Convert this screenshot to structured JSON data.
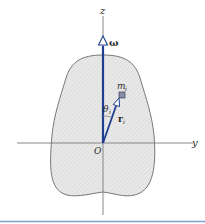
{
  "figure": {
    "labels": {
      "z_axis": "z",
      "y_axis": "y",
      "origin": "O",
      "omega": "ω",
      "mass": "m",
      "mass_sub": "i",
      "theta": "θ",
      "theta_sub": "i",
      "r": "r",
      "r_sub": "i"
    },
    "colors": {
      "vector": "#1e3f8f",
      "axis": "#7a7a7a",
      "body_fill": "#e6e6e6",
      "body_stroke": "#6a6a6a",
      "mass_fill": "#8a8fa8",
      "bottom_rule": "#7f9fd0"
    }
  }
}
